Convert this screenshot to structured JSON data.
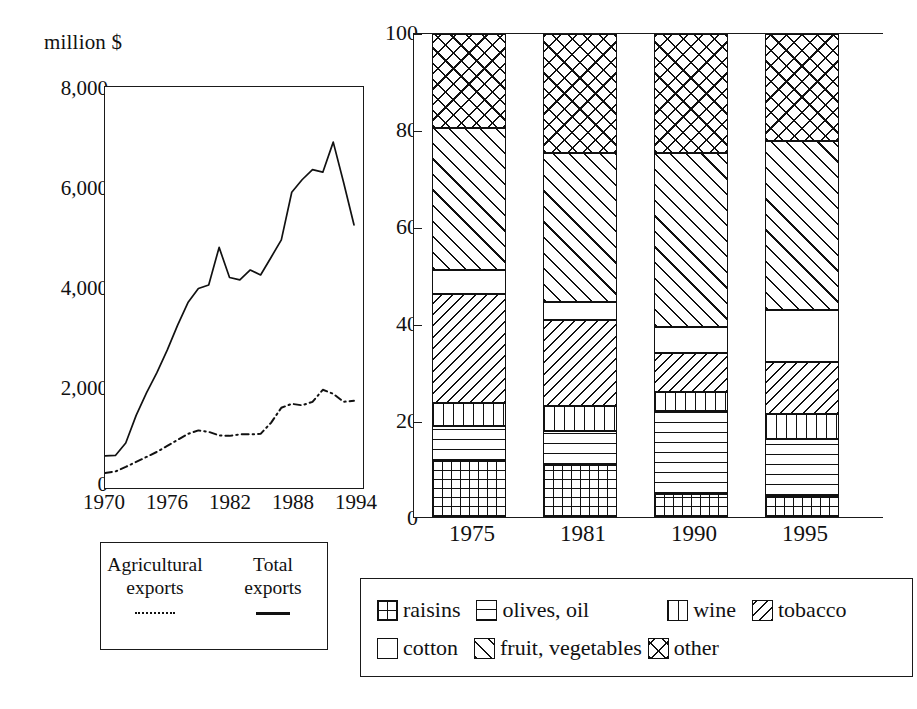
{
  "line_chart": {
    "y_axis_title": "million $",
    "y_ticks": [
      "8,000",
      "6,000",
      "4,000",
      "2,000",
      "0"
    ],
    "x_ticks": [
      "1970",
      "1976",
      "1982",
      "1988",
      "1994"
    ],
    "legend": {
      "col1_line1": "Agricultural",
      "col1_line2": "exports",
      "col1_mark": "dash-dot-line",
      "col2_line1": "Total",
      "col2_line2": "exports",
      "col2_mark": "solid-line"
    }
  },
  "bar_chart": {
    "y_ticks": [
      "100",
      "80",
      "60",
      "40",
      "20",
      "0"
    ],
    "x_ticks": [
      "1975",
      "1981",
      "1990",
      "1995"
    ],
    "legend_items": [
      {
        "label": "raisins",
        "pattern": "pat-raisins"
      },
      {
        "label": "olives, oil",
        "pattern": "pat-olives"
      },
      {
        "label": "wine",
        "pattern": "pat-wine"
      },
      {
        "label": "tobacco",
        "pattern": "pat-tobacco"
      },
      {
        "label": "cotton",
        "pattern": "pat-cotton"
      },
      {
        "label": "fruit, vegetables",
        "pattern": "pat-fruit"
      },
      {
        "label": "other",
        "pattern": "pat-other"
      }
    ]
  },
  "chart_data": [
    {
      "type": "line",
      "title": "",
      "xlabel": "",
      "ylabel": "million $",
      "xlim": [
        1970,
        1995
      ],
      "ylim": [
        0,
        8000
      ],
      "yticks": [
        0,
        2000,
        4000,
        6000,
        8000
      ],
      "xticks": [
        1970,
        1976,
        1982,
        1988,
        1994
      ],
      "grid": false,
      "legend_position": "below-plot",
      "series": [
        {
          "name": "Total exports",
          "style": "solid",
          "x": [
            1970,
            1971,
            1972,
            1973,
            1974,
            1975,
            1976,
            1977,
            1978,
            1979,
            1980,
            1981,
            1982,
            1983,
            1984,
            1985,
            1986,
            1987,
            1988,
            1989,
            1990,
            1991,
            1992,
            1993,
            1994
          ],
          "values": [
            640,
            650,
            900,
            1450,
            1900,
            2300,
            2750,
            3250,
            3700,
            3980,
            4050,
            4800,
            4200,
            4150,
            4350,
            4250,
            4600,
            4950,
            5900,
            6150,
            6350,
            6300,
            6900,
            6100,
            5250
          ]
        },
        {
          "name": "Agricultural exports",
          "style": "dash-dot",
          "x": [
            1970,
            1971,
            1972,
            1973,
            1974,
            1975,
            1976,
            1977,
            1978,
            1979,
            1980,
            1981,
            1982,
            1983,
            1984,
            1985,
            1986,
            1987,
            1988,
            1989,
            1990,
            1991,
            1992,
            1993,
            1994
          ],
          "values": [
            300,
            330,
            420,
            520,
            620,
            720,
            840,
            960,
            1080,
            1150,
            1120,
            1050,
            1040,
            1070,
            1070,
            1080,
            1300,
            1600,
            1680,
            1650,
            1720,
            1960,
            1880,
            1720,
            1740,
            1720
          ]
        }
      ]
    },
    {
      "type": "bar",
      "subtype": "stacked-100-percent",
      "title": "",
      "xlabel": "",
      "ylabel": "",
      "ylim": [
        0,
        100
      ],
      "yticks": [
        0,
        20,
        40,
        60,
        80,
        100
      ],
      "grid": false,
      "legend_position": "below-plot",
      "categories": [
        "1975",
        "1981",
        "1990",
        "1995"
      ],
      "series": [
        {
          "name": "raisins",
          "pattern": "fine-grid",
          "values": [
            11.5,
            10.7,
            4.7,
            4.3
          ]
        },
        {
          "name": "olives, oil",
          "pattern": "horizontal-lines",
          "values": [
            7.3,
            7.2,
            17.2,
            11.8
          ]
        },
        {
          "name": "wine",
          "pattern": "vertical-lines",
          "values": [
            4.9,
            5.1,
            3.9,
            5.3
          ]
        },
        {
          "name": "tobacco",
          "pattern": "back-diagonal",
          "values": [
            22.5,
            17.8,
            8.2,
            10.6
          ]
        },
        {
          "name": "cotton",
          "pattern": "blank",
          "values": [
            4.9,
            3.7,
            5.4,
            10.9
          ]
        },
        {
          "name": "fruit, vegetables",
          "pattern": "forward-diagonal",
          "values": [
            29.5,
            30.8,
            35.9,
            35.0
          ]
        },
        {
          "name": "other",
          "pattern": "cross-diagonal",
          "values": [
            19.4,
            24.7,
            24.7,
            22.1
          ]
        }
      ],
      "cumulative_tops": {
        "1975": [
          11.5,
          18.8,
          23.7,
          46.2,
          51.1,
          80.6,
          100
        ],
        "1981": [
          10.7,
          17.9,
          23.0,
          40.8,
          44.5,
          75.3,
          100
        ],
        "1990": [
          4.7,
          21.9,
          25.8,
          34.0,
          39.4,
          75.3,
          100
        ],
        "1995": [
          4.3,
          16.1,
          21.4,
          32.0,
          42.9,
          77.9,
          100
        ]
      }
    }
  ]
}
